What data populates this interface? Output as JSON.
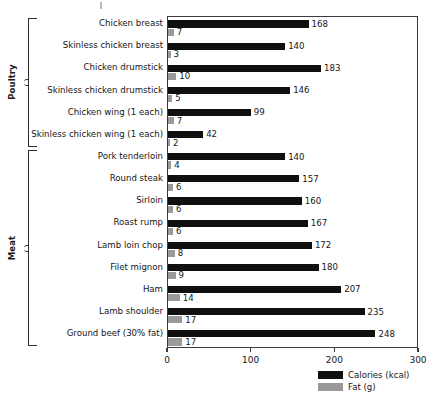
{
  "chart_data": {
    "type": "bar",
    "title": "",
    "subtitle": "",
    "xlabel": "",
    "ylabel": "",
    "orientation": "horizontal",
    "grid": false,
    "xlim": [
      0,
      300
    ],
    "xticks": [
      0,
      100,
      200,
      300
    ],
    "xtick_labels": [
      "0",
      "100",
      "200",
      "300"
    ],
    "legend_position": "bottom-right",
    "categories": [
      "Chicken breast",
      "Skinless chicken breast",
      "Chicken drumstick",
      "Skinless chicken drumstick",
      "Chicken wing (1 each)",
      "Skinless chicken wing (1 each)",
      "Pork tenderloin",
      "Round steak",
      "Sirloin",
      "Roast rump",
      "Lamb loin chop",
      "Filet mignon",
      "Ham",
      "Lamb shoulder",
      "Ground beef (30% fat)"
    ],
    "series": [
      {
        "name": "Calories (kcal)",
        "color": "#101010",
        "values": [
          168,
          140,
          183,
          146,
          99,
          42,
          140,
          157,
          160,
          167,
          172,
          180,
          207,
          235,
          248
        ]
      },
      {
        "name": "Fat (g)",
        "color": "#9a9a9a",
        "values": [
          7,
          3,
          10,
          5,
          7,
          2,
          4,
          6,
          6,
          6,
          8,
          9,
          14,
          17,
          17
        ]
      }
    ],
    "groups": [
      {
        "label": "Poultry",
        "start_index": 0,
        "end_index": 5
      },
      {
        "label": "Meat",
        "start_index": 6,
        "end_index": 14
      }
    ]
  },
  "legend": {
    "items": [
      {
        "label": "Calories (kcal)",
        "swatch": "cal"
      },
      {
        "label": "Fat (g)",
        "swatch": "fat"
      }
    ]
  }
}
